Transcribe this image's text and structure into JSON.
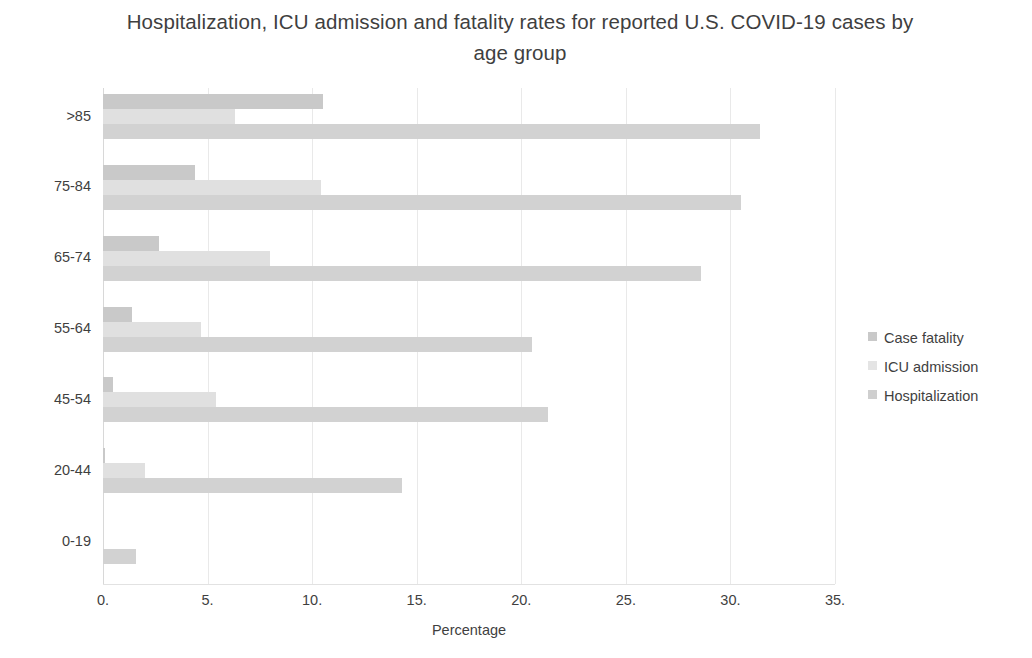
{
  "chart_data": {
    "type": "bar",
    "orientation": "horizontal",
    "title": "Hospitalization, ICU admission and fatality rates for reported U.S. COVID-19 cases by age group",
    "xlabel": "Percentage",
    "ylabel": "",
    "xlim": [
      0,
      35
    ],
    "xticks": [
      "0.",
      "5.",
      "10.",
      "15.",
      "20.",
      "25.",
      "30.",
      "35."
    ],
    "xtick_values": [
      0,
      5,
      10,
      15,
      20,
      25,
      30,
      35
    ],
    "grid": true,
    "legend_position": "right",
    "categories": [
      "0-19",
      "20-44",
      "45-54",
      "55-64",
      "65-74",
      "75-84",
      ">85"
    ],
    "categories_display_order": [
      ">85",
      "75-84",
      "65-74",
      "55-64",
      "45-54",
      "20-44",
      "0-19"
    ],
    "series": [
      {
        "name": "Case fatality",
        "color": "#c9c9c9",
        "values_by_category": {
          "0-19": 0.0,
          "20-44": 0.1,
          "45-54": 0.5,
          "55-64": 1.4,
          "65-74": 2.7,
          "75-84": 4.4,
          ">85": 10.5
        },
        "values": [
          0.0,
          0.1,
          0.5,
          1.4,
          2.7,
          4.4,
          10.5
        ]
      },
      {
        "name": "ICU admission",
        "color": "#e0e0e0",
        "values_by_category": {
          "0-19": 0.0,
          "20-44": 2.0,
          "45-54": 5.4,
          "55-64": 4.7,
          "65-74": 8.0,
          "75-84": 10.4,
          ">85": 6.3
        },
        "values": [
          0.0,
          2.0,
          5.4,
          4.7,
          8.0,
          10.4,
          6.3
        ]
      },
      {
        "name": "Hospitalization",
        "color": "#d2d2d2",
        "values_by_category": {
          "0-19": 1.6,
          "20-44": 14.3,
          "45-54": 21.3,
          "55-64": 20.5,
          "65-74": 28.6,
          "75-84": 30.5,
          ">85": 31.4
        },
        "values": [
          1.6,
          14.3,
          21.3,
          20.5,
          28.6,
          30.5,
          31.4
        ]
      }
    ],
    "legend_entries": [
      "Case fatality",
      "ICU admission",
      "Hospitalization"
    ]
  },
  "legend": {
    "items": [
      {
        "label": "Case fatality",
        "color": "#c9c9c9"
      },
      {
        "label": "ICU admission",
        "color": "#e4e4e4"
      },
      {
        "label": "Hospitalization",
        "color": "#cfcfcf"
      }
    ]
  },
  "axis": {
    "x_title": "Percentage",
    "ticks_x": [
      "0.",
      "5.",
      "10.",
      "15.",
      "20.",
      "25.",
      "30.",
      "35."
    ],
    "ticks_y": [
      ">85",
      "75-84",
      "65-74",
      "55-64",
      "45-54",
      "20-44",
      "0-19"
    ]
  },
  "title": {
    "text": "Hospitalization, ICU admission and fatality rates for reported U.S. COVID-19 cases by age group"
  },
  "colors": {
    "case_fatality": "#c9c9c9",
    "icu_admission": "#e2e2e2",
    "hospitalization": "#d2d2d2",
    "gridline": "#e9e9e9",
    "text": "#3f3f3f"
  }
}
